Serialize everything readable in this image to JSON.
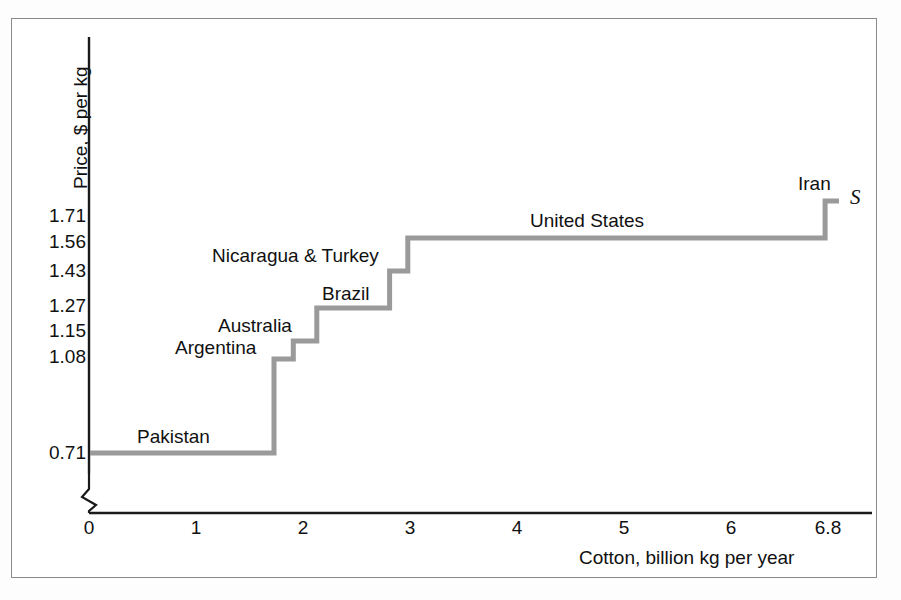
{
  "figure": {
    "background_color": "#ffffff",
    "frame_color": "#8a8a8a"
  },
  "axes": {
    "y_title": "Price, $ per kg",
    "x_title": "Cotton, billion kg per year",
    "y_ticks": [
      "0.71",
      "1.08",
      "1.15",
      "1.27",
      "1.43",
      "1.56",
      "1.71"
    ],
    "x_ticks": [
      "0",
      "1",
      "2",
      "3",
      "4",
      "5",
      "6",
      "6.8"
    ],
    "y_axis_break": true,
    "x_axis_break": false
  },
  "curve": {
    "label": "S",
    "color": "#9a9a9a",
    "line_width": 5
  },
  "series_labels": [
    "Pakistan",
    "Argentina",
    "Australia",
    "Brazil",
    "Nicaragua & Turkey",
    "United States",
    "Iran"
  ],
  "chart_data": {
    "type": "line",
    "subtype": "step-supply-curve",
    "title": "",
    "xlabel": "Cotton, billion kg per year",
    "ylabel": "Price, $ per kg",
    "xlim": [
      0,
      6.8
    ],
    "ylim": [
      0.71,
      1.78
    ],
    "grid": false,
    "legend": "none",
    "x_tick_values": [
      0,
      1,
      2,
      3,
      4,
      5,
      6,
      6.8
    ],
    "y_tick_values": [
      0.71,
      1.08,
      1.15,
      1.27,
      1.43,
      1.56,
      1.71
    ],
    "curve_name": "S",
    "steps": [
      {
        "label": "Pakistan",
        "price": 0.71,
        "x_start": 0.0,
        "x_end": 1.72,
        "quantity": 1.72
      },
      {
        "label": "Argentina",
        "price": 1.08,
        "x_start": 1.72,
        "x_end": 1.9,
        "quantity": 0.18
      },
      {
        "label": "Australia",
        "price": 1.15,
        "x_start": 1.9,
        "x_end": 2.12,
        "quantity": 0.22
      },
      {
        "label": "Brazil",
        "price": 1.27,
        "x_start": 2.12,
        "x_end": 2.8,
        "quantity": 0.68
      },
      {
        "label": "Nicaragua & Turkey",
        "price": 1.43,
        "x_start": 2.8,
        "x_end": 2.97,
        "quantity": 0.17
      },
      {
        "label": "United States",
        "price": 1.56,
        "x_start": 2.97,
        "x_end": 6.87,
        "quantity": 3.9
      },
      {
        "label": "Iran",
        "price": 1.71,
        "x_start": 6.87,
        "x_end": 7.0,
        "quantity": 0.13
      }
    ]
  }
}
